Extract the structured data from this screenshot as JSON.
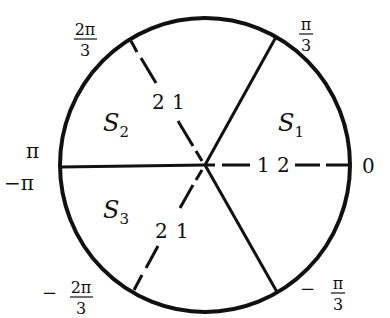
{
  "diagram": {
    "type": "circle-partition",
    "center": "origin",
    "regions": [
      {
        "name": "S1",
        "base": "S",
        "sub": "1"
      },
      {
        "name": "S2",
        "base": "S",
        "sub": "2"
      },
      {
        "name": "S3",
        "base": "S",
        "sub": "3"
      }
    ],
    "angle_labels": {
      "zero": "0",
      "pi_over_3": {
        "num": "π",
        "den": "3"
      },
      "two_pi_over_3": {
        "num": "2π",
        "den": "3"
      },
      "pi": "π",
      "neg_pi": "−π",
      "neg_two_pi_over_3": {
        "sign": "−",
        "num": "2π",
        "den": "3"
      },
      "neg_pi_over_3": {
        "sign": "−",
        "num": "π",
        "den": "3"
      }
    },
    "dashed_ray_labels": {
      "ray_0": [
        "1",
        "2"
      ],
      "ray_2pi3": [
        "2",
        "1"
      ],
      "ray_neg2pi3": [
        "2",
        "1"
      ]
    },
    "solid_rays": [
      "π/3",
      "π",
      "−π/3"
    ],
    "dashed_rays": [
      "0",
      "2π/3",
      "−2π/3"
    ]
  }
}
